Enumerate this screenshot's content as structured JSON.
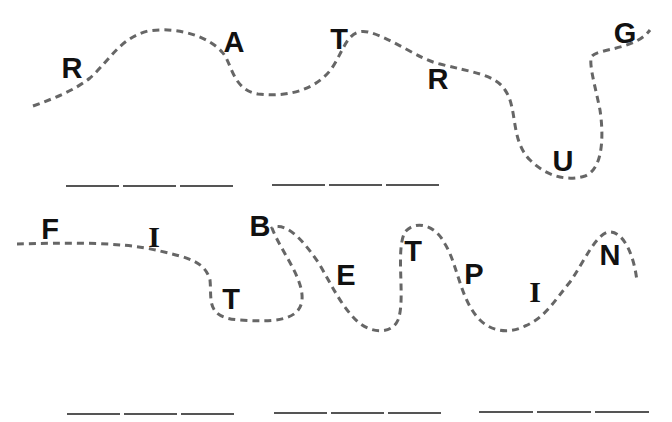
{
  "puzzle": {
    "heading_visible": false,
    "rows": [
      {
        "id": "row-1",
        "letters": [
          {
            "char": "R",
            "x": 72,
            "y": 68
          },
          {
            "char": "A",
            "x": 234,
            "y": 42
          },
          {
            "char": "T",
            "x": 339,
            "y": 39
          },
          {
            "char": "R",
            "x": 438,
            "y": 79
          },
          {
            "char": "U",
            "x": 563,
            "y": 161
          },
          {
            "char": "G",
            "x": 625,
            "y": 33
          }
        ],
        "blank_groups": [
          {
            "count": 3,
            "x": 66,
            "y": 185,
            "segment_width": 53
          },
          {
            "count": 3,
            "x": 272,
            "y": 184,
            "segment_width": 53
          }
        ]
      },
      {
        "id": "row-2",
        "letters": [
          {
            "char": "F",
            "x": 50,
            "y": 229
          },
          {
            "char": "I",
            "x": 154,
            "y": 237,
            "serif": true
          },
          {
            "char": "T",
            "x": 231,
            "y": 299
          },
          {
            "char": "B",
            "x": 260,
            "y": 226
          },
          {
            "char": "E",
            "x": 346,
            "y": 275
          },
          {
            "char": "T",
            "x": 413,
            "y": 251
          },
          {
            "char": "P",
            "x": 474,
            "y": 274
          },
          {
            "char": "I",
            "x": 535,
            "y": 292,
            "serif": true
          },
          {
            "char": "N",
            "x": 610,
            "y": 255
          }
        ],
        "blank_groups": [
          {
            "count": 3,
            "x": 67,
            "y": 413,
            "segment_width": 53
          },
          {
            "count": 3,
            "x": 274,
            "y": 412,
            "segment_width": 53
          },
          {
            "count": 3,
            "x": 479,
            "y": 411,
            "segment_width": 54
          }
        ]
      }
    ],
    "colors": {
      "dash": "#666666",
      "letter": "#111111",
      "blank_line": "#555555",
      "background": "#ffffff"
    }
  }
}
